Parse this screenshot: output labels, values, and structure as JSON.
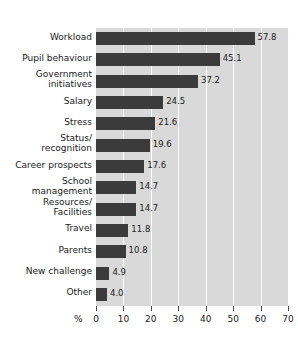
{
  "chart_data": {
    "type": "bar",
    "orientation": "horizontal",
    "title": "",
    "xlabel": "%",
    "ylabel": "",
    "xlim": [
      0,
      70
    ],
    "xticks": [
      0,
      10,
      20,
      30,
      40,
      50,
      60,
      70
    ],
    "grid": true,
    "legend": null,
    "bar_color": "#3b3b3b",
    "plot_background": "#d9d9d9",
    "gridline_color": "#ffffff",
    "categories": [
      "Workload",
      "Pupil behaviour",
      "Government\ninitiatives",
      "Salary",
      "Stress",
      "Status/\nrecognition",
      "Career prospects",
      "School\nmanagement",
      "Resources/\nFacilities",
      "Travel",
      "Parents",
      "New challenge",
      "Other"
    ],
    "values": [
      57.8,
      45.1,
      37.2,
      24.5,
      21.6,
      19.6,
      17.6,
      14.7,
      14.7,
      11.8,
      10.8,
      4.9,
      4.0
    ],
    "value_labels": [
      "57.8",
      "45.1",
      "37.2",
      "24.5",
      "21.6",
      "19.6",
      "17.6",
      "14.7",
      "14.7",
      "11.8",
      "10.8",
      "4.9",
      "4.0"
    ]
  },
  "title_remnant": ""
}
